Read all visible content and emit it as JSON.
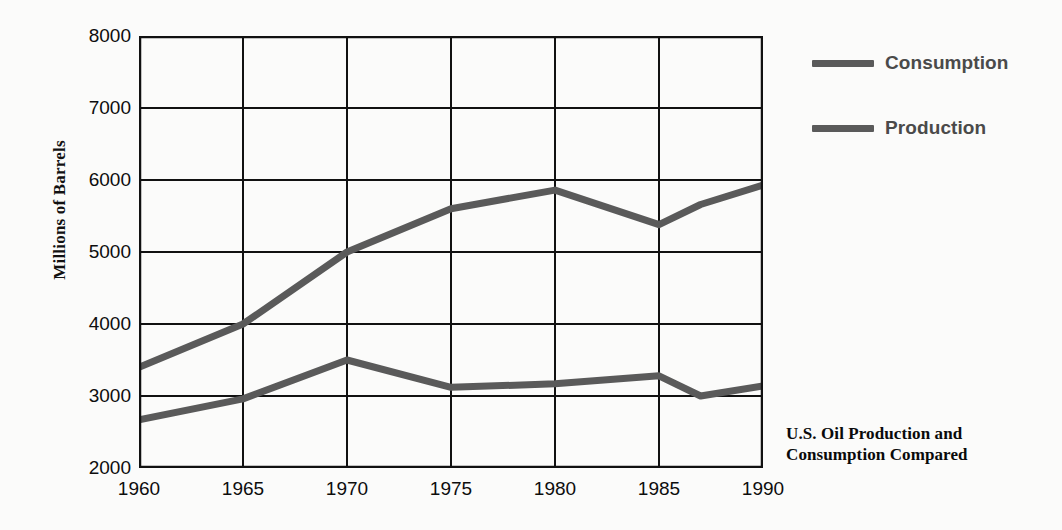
{
  "chart_data": {
    "type": "line",
    "title": "U.S. Oil Production and Consumption Compared",
    "title_line1": "U.S. Oil Production and",
    "title_line2": "Consumption Compared",
    "xlabel": "",
    "ylabel": "Millions of Barrels",
    "xlim": [
      1960,
      1990
    ],
    "ylim": [
      2000,
      8000
    ],
    "grid": true,
    "legend_position": "right",
    "x": [
      1960,
      1965,
      1970,
      1975,
      1980,
      1985,
      1987,
      1990
    ],
    "xticks": [
      "1960",
      "1965",
      "1970",
      "1975",
      "1980",
      "1985",
      "1990"
    ],
    "xtick_values": [
      1960,
      1965,
      1970,
      1975,
      1980,
      1985,
      1990
    ],
    "yticks": [
      "8000",
      "7000",
      "6000",
      "5000",
      "4000",
      "3000",
      "2000"
    ],
    "ytick_values": [
      8000,
      7000,
      6000,
      5000,
      4000,
      3000,
      2000
    ],
    "series": [
      {
        "name": "Consumption",
        "color": "#5a5a5a",
        "values": [
          3400,
          4000,
          5000,
          5600,
          5860,
          5380,
          5660,
          5930
        ]
      },
      {
        "name": "Production",
        "color": "#5a5a5a",
        "values": [
          2670,
          2960,
          3500,
          3120,
          3170,
          3280,
          3000,
          3140
        ]
      }
    ]
  },
  "legend": {
    "items": [
      {
        "label": "Consumption",
        "color": "#5a5a5a"
      },
      {
        "label": "Production",
        "color": "#5a5a5a"
      }
    ]
  },
  "axes": {
    "y_title": "Millions of Barrels",
    "axis_color": "#111111"
  },
  "caption": {
    "line1": "U.S. Oil Production and",
    "line2": "Consumption Compared"
  }
}
